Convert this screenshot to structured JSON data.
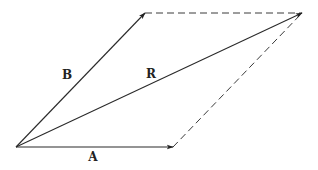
{
  "diagram": {
    "type": "vector-parallelogram",
    "labels": {
      "a": "A",
      "b": "B",
      "r": "R"
    },
    "points": {
      "origin": [
        16,
        147
      ],
      "a_end": [
        173,
        147
      ],
      "b_end": [
        145,
        13
      ],
      "r_end": [
        302,
        13
      ]
    },
    "label_positions": {
      "a": [
        93,
        157
      ],
      "b": [
        67,
        75
      ],
      "r": [
        151,
        74
      ]
    },
    "vectors": [
      {
        "name": "A",
        "from": "origin",
        "to": "a_end",
        "style": "solid-arrow"
      },
      {
        "name": "B",
        "from": "origin",
        "to": "b_end",
        "style": "solid-arrow"
      },
      {
        "name": "R",
        "from": "origin",
        "to": "r_end",
        "style": "solid-arrow"
      }
    ],
    "construction_lines": [
      {
        "from": "b_end",
        "to": "r_end",
        "style": "dashed"
      },
      {
        "from": "a_end",
        "to": "r_end",
        "style": "dashed"
      }
    ],
    "colors": {
      "line": "#2a2a2a",
      "background": "#ffffff"
    }
  }
}
